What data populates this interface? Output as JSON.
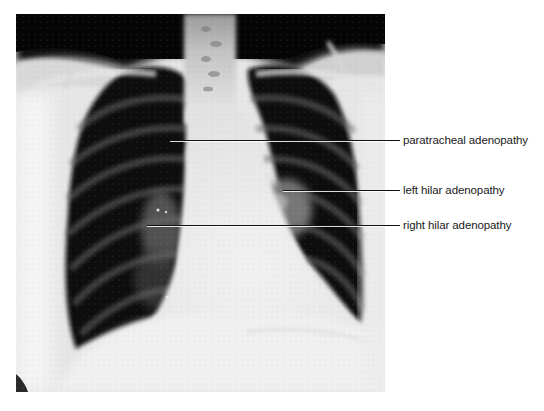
{
  "figure": {
    "type": "chest radiograph (PA view)",
    "annotations": [
      {
        "id": "paratracheal",
        "label": "paratracheal adenopathy",
        "line_y": 140,
        "line_x_start": 170,
        "label_y": 133
      },
      {
        "id": "left-hilar",
        "label": "left hilar adenopathy",
        "line_y": 190,
        "line_x_start": 283,
        "label_y": 183
      },
      {
        "id": "right-hilar",
        "label": "right hilar adenopathy",
        "line_y": 225,
        "line_x_start": 147,
        "label_y": 218
      }
    ]
  },
  "colors": {
    "background": "#ffffff",
    "label_text": "#1a1a1a",
    "leader_line": "#111111",
    "lung_field": "#0c0c0c",
    "soft_tissue": "#e8e8e8"
  }
}
